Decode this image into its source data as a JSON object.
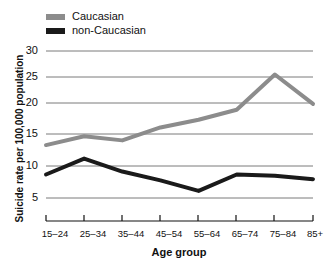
{
  "chart_data": {
    "type": "line",
    "title": "",
    "xlabel": "Age group",
    "ylabel": "Suicide rate per 100,000 population",
    "categories": [
      "15–24",
      "25–34",
      "35–44",
      "45–54",
      "55–64",
      "65–74",
      "75–84",
      "85+"
    ],
    "yticks": [
      5,
      10,
      15,
      20,
      25,
      30
    ],
    "ylim": [
      2.5,
      30
    ],
    "grid": true,
    "legend_position": "top-left",
    "series": [
      {
        "name": "Caucasian",
        "color": "#8c8c8c",
        "values": [
          14.0,
          15.5,
          14.8,
          17.0,
          18.3,
          20.0,
          26.0,
          21.0
        ]
      },
      {
        "name": "non-Caucasian",
        "color": "#1a1a1a",
        "values": [
          9.0,
          11.7,
          9.5,
          8.0,
          6.2,
          9.0,
          8.8,
          8.2
        ]
      }
    ]
  },
  "legend": {
    "items": [
      {
        "label": "Caucasian",
        "color": "#8c8c8c"
      },
      {
        "label": "non-Caucasian",
        "color": "#1a1a1a"
      }
    ]
  },
  "axes": {
    "y_title": "Suicide rate per 100,000 population",
    "x_title": "Age group",
    "y_tick_labels": [
      "30",
      "25",
      "20",
      "15",
      "10",
      "5"
    ],
    "x_tick_labels": [
      "15–24",
      "25–34",
      "35–44",
      "45–54",
      "55–64",
      "65–74",
      "75–84",
      "85+"
    ]
  },
  "style": {
    "grid_color": "#7a7a7a",
    "axis_color": "#111111",
    "background": "#ffffff"
  }
}
